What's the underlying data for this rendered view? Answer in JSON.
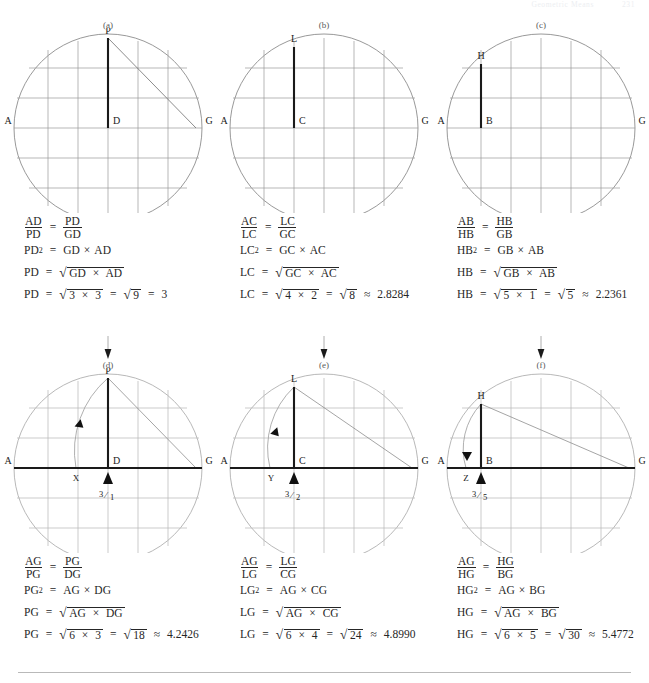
{
  "running_head": {
    "left": "Geometric Means",
    "right": "231"
  },
  "figures": [
    {
      "id": "a",
      "label": "(a)",
      "points": {
        "apex": "P",
        "foot": "D",
        "left": "A",
        "right": "G"
      },
      "has_diagonal": true,
      "has_arc": false,
      "equations": [
        {
          "type": "proportion",
          "ln": "AD",
          "ld": "PD",
          "rn": "PD",
          "rd": "GD"
        },
        {
          "type": "square",
          "lhs": "PD",
          "a": "GD",
          "b": "AD"
        },
        {
          "type": "root",
          "lhs": "PD",
          "a": "GD",
          "b": "AC_placeholder"
        },
        {
          "type": "numeric",
          "lhs": "PD",
          "a": "3",
          "b": "3",
          "product": "9",
          "rel": "=",
          "result": "3"
        }
      ],
      "root_operands": {
        "a": "GD",
        "b": "AD"
      }
    },
    {
      "id": "b",
      "label": "(b)",
      "points": {
        "apex": "L",
        "foot": "C",
        "left": "A",
        "right": "G"
      },
      "has_diagonal": false,
      "has_arc": false,
      "equations": [
        {
          "type": "proportion",
          "ln": "AC",
          "ld": "LC",
          "rn": "LC",
          "rd": "GC"
        },
        {
          "type": "square",
          "lhs": "LC",
          "a": "GC",
          "b": "AC"
        },
        {
          "type": "root",
          "lhs": "LC"
        },
        {
          "type": "numeric",
          "lhs": "LC",
          "a": "4",
          "b": "2",
          "product": "8",
          "rel": "≈",
          "result": "2.8284"
        }
      ],
      "root_operands": {
        "a": "GC",
        "b": "AC"
      }
    },
    {
      "id": "c",
      "label": "(c)",
      "points": {
        "apex": "H",
        "foot": "B",
        "left": "A",
        "right": "G"
      },
      "has_diagonal": false,
      "has_arc": false,
      "equations": [
        {
          "type": "proportion",
          "ln": "AB",
          "ld": "HB",
          "rn": "HB",
          "rd": "GB"
        },
        {
          "type": "square",
          "lhs": "HB",
          "a": "GB",
          "b": "AB"
        },
        {
          "type": "root",
          "lhs": "HB"
        },
        {
          "type": "numeric",
          "lhs": "HB",
          "a": "5",
          "b": "1",
          "product": "5",
          "rel": "≈",
          "result": "2.2361"
        }
      ],
      "root_operands": {
        "a": "GB",
        "b": "AB"
      }
    },
    {
      "id": "d",
      "label": "(d)",
      "points": {
        "apex": "P",
        "foot": "D",
        "left": "A",
        "right": "G",
        "arc_end": "X"
      },
      "has_diagonal": true,
      "has_arc": true,
      "marker_fraction": {
        "num": "3",
        "den": "1"
      },
      "equations": [
        {
          "type": "proportion",
          "ln": "AG",
          "ld": "PG",
          "rn": "PG",
          "rd": "DG"
        },
        {
          "type": "square",
          "lhs": "PG",
          "a": "AG",
          "b": "DG"
        },
        {
          "type": "root",
          "lhs": "PG"
        },
        {
          "type": "numeric",
          "lhs": "PG",
          "a": "6",
          "b": "3",
          "product": "18",
          "rel": "≈",
          "result": "4.2426"
        }
      ],
      "root_operands": {
        "a": "AG",
        "b": "DG"
      }
    },
    {
      "id": "e",
      "label": "(e)",
      "points": {
        "apex": "L",
        "foot": "C",
        "left": "A",
        "right": "G",
        "arc_end": "Y"
      },
      "has_diagonal": true,
      "has_arc": true,
      "marker_fraction": {
        "num": "3",
        "den": "2"
      },
      "equations": [
        {
          "type": "proportion",
          "ln": "AG",
          "ld": "LG",
          "rn": "LG",
          "rd": "CG"
        },
        {
          "type": "square",
          "lhs": "LG",
          "a": "AG",
          "b": "CG"
        },
        {
          "type": "root",
          "lhs": "LG"
        },
        {
          "type": "numeric",
          "lhs": "LG",
          "a": "6",
          "b": "4",
          "product": "24",
          "rel": "≈",
          "result": "4.8990"
        }
      ],
      "root_operands": {
        "a": "AG",
        "b": "CG"
      }
    },
    {
      "id": "f",
      "label": "(f)",
      "points": {
        "apex": "H",
        "foot": "B",
        "left": "A",
        "right": "G",
        "arc_end": "Z"
      },
      "has_diagonal": true,
      "has_arc": true,
      "marker_fraction": {
        "num": "3",
        "den": "5"
      },
      "equations": [
        {
          "type": "proportion",
          "ln": "AG",
          "ld": "HG",
          "rn": "HG",
          "rd": "BG"
        },
        {
          "type": "square",
          "lhs": "HG",
          "a": "AG",
          "b": "BG"
        },
        {
          "type": "root",
          "lhs": "HG"
        },
        {
          "type": "numeric",
          "lhs": "HG",
          "a": "6",
          "b": "5",
          "product": "30",
          "rel": "≈",
          "result": "5.4772"
        }
      ],
      "root_operands": {
        "a": "AG",
        "b": "BG"
      }
    }
  ],
  "symbols": {
    "equals": "=",
    "times": "×",
    "radical": "√",
    "squared": "2",
    "approx": "≈",
    "arrow_down": "↓"
  },
  "colors": {
    "ink": "#262626",
    "grid": "#9a9a9a",
    "circle": "#8d8d8d",
    "bold_segment": "#1a1a1a",
    "label_gray": "#5a5a5a"
  }
}
